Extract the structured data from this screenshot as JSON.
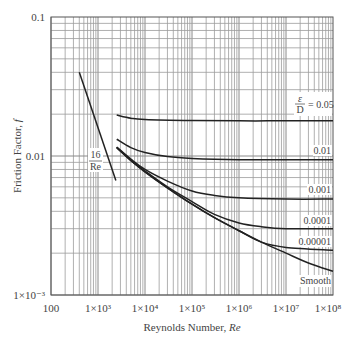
{
  "chart_data": {
    "type": "line",
    "title": "",
    "xlabel": "Reynolds Number, Re",
    "ylabel": "Friction Factor, f",
    "xscale": "log",
    "yscale": "log",
    "xlim": [
      100,
      100000000
    ],
    "ylim": [
      0.001,
      0.1
    ],
    "grid": true,
    "x_tick_labels": [
      "100",
      "1×10³",
      "1×10⁴",
      "1×10⁵",
      "1×10⁶",
      "1×10⁷",
      "1×10⁸"
    ],
    "x_tick_values": [
      100,
      1000,
      10000,
      100000,
      1000000,
      10000000,
      100000000
    ],
    "y_tick_labels": [
      "0.1",
      "0.01",
      "1×10⁻³"
    ],
    "y_tick_values": [
      0.1,
      0.01,
      0.001
    ],
    "series": [
      {
        "name": "16/Re",
        "label": "16/Re",
        "x": [
          400,
          2400
        ],
        "y": [
          0.04,
          0.00667
        ]
      },
      {
        "name": "ε/D = 0.05",
        "label": "ε/D = 0.05",
        "x": [
          2500,
          5000,
          10000,
          100000,
          1000000,
          10000000,
          100000000
        ],
        "y": [
          0.0197,
          0.0187,
          0.0183,
          0.018,
          0.0179,
          0.0179,
          0.0179
        ]
      },
      {
        "name": "ε/D = 0.01",
        "label": "0.01",
        "x": [
          2500,
          5000,
          10000,
          30000,
          100000,
          1000000,
          10000000,
          100000000
        ],
        "y": [
          0.0132,
          0.0115,
          0.0106,
          0.0099,
          0.0096,
          0.0094,
          0.0094,
          0.0094
        ]
      },
      {
        "name": "ε/D = 0.001",
        "label": "0.001",
        "x": [
          2500,
          5000,
          10000,
          30000,
          100000,
          300000,
          1000000,
          10000000,
          100000000
        ],
        "y": [
          0.0116,
          0.0095,
          0.008,
          0.0066,
          0.0056,
          0.0052,
          0.005,
          0.0049,
          0.0049
        ]
      },
      {
        "name": "ε/D = 0.0001",
        "label": "0.0001",
        "x": [
          2500,
          5000,
          10000,
          30000,
          100000,
          300000,
          1000000,
          3000000,
          10000000,
          100000000
        ],
        "y": [
          0.0115,
          0.0093,
          0.0078,
          0.006,
          0.0047,
          0.0038,
          0.0033,
          0.0031,
          0.003,
          0.003
        ]
      },
      {
        "name": "ε/D = 0.00001",
        "label": "0.00001",
        "x": [
          2500,
          5000,
          10000,
          30000,
          100000,
          300000,
          1000000,
          3000000,
          10000000,
          100000000
        ],
        "y": [
          0.0115,
          0.0093,
          0.0077,
          0.0059,
          0.0045,
          0.0036,
          0.0029,
          0.0024,
          0.0022,
          0.0021
        ]
      },
      {
        "name": "Smooth",
        "label": "Smooth",
        "x": [
          2500,
          5000,
          10000,
          30000,
          100000,
          300000,
          1000000,
          3000000,
          10000000,
          30000000,
          100000000
        ],
        "y": [
          0.0115,
          0.0093,
          0.0077,
          0.0059,
          0.0045,
          0.0036,
          0.0029,
          0.0024,
          0.002,
          0.0017,
          0.00148
        ]
      }
    ],
    "annotations": [
      {
        "text": "16/Re",
        "near": "laminar line"
      },
      {
        "text": "ε/D = 0.05",
        "near": "top turbulent curve, right end"
      },
      {
        "text": "0.01",
        "near": "second curve, right end"
      },
      {
        "text": "0.001",
        "near": "third curve, right end"
      },
      {
        "text": "0.0001",
        "near": "fourth curve, right end"
      },
      {
        "text": "0.00001",
        "near": "fifth curve, right end"
      },
      {
        "text": "Smooth",
        "near": "bottom curve, right end"
      }
    ]
  },
  "labels": {
    "xlabel_main": "Reynolds Number, ",
    "xlabel_italic": "Re",
    "ylabel_main": "Friction Factor, ",
    "ylabel_italic": "f",
    "laminar_num": "16",
    "laminar_den": "Re",
    "eps_num": "ε",
    "eps_den": "D",
    "eps_value": "= 0.05",
    "curve_001": "0.01",
    "curve_0001": "0.001",
    "curve_00001": "0.0001",
    "curve_000001": "0.00001",
    "curve_smooth": "Smooth"
  }
}
